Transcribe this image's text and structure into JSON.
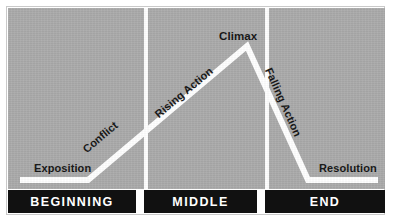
{
  "diagram": {
    "panel_color": "#a9a9a9",
    "line_color": "#ffffff",
    "bar_color": "#111111",
    "text_color": "#111111"
  },
  "arc_labels": {
    "exposition": "Exposition",
    "conflict": "Conflict",
    "rising_action": "Rising Action",
    "climax": "Climax",
    "falling_action": "Falling Action",
    "resolution": "Resolution"
  },
  "stages": [
    {
      "label": "BEGINNING"
    },
    {
      "label": "MIDDLE"
    },
    {
      "label": "END"
    }
  ],
  "chart_data": {
    "type": "line",
    "xlabel": "",
    "ylabel": "",
    "grid": false,
    "legend": "none",
    "xlim": [
      0,
      377
    ],
    "ylim": [
      0,
      181
    ],
    "series": [
      {
        "name": "Story Arc",
        "points": [
          {
            "x": 12,
            "y": 172,
            "stage": "Exposition"
          },
          {
            "x": 80,
            "y": 172,
            "stage": "Conflict start"
          },
          {
            "x": 239,
            "y": 38,
            "stage": "Climax"
          },
          {
            "x": 300,
            "y": 172,
            "stage": "Resolution start"
          },
          {
            "x": 370,
            "y": 172,
            "stage": "Resolution end"
          }
        ]
      }
    ],
    "annotations": [
      {
        "text": "Exposition",
        "x": 26,
        "y": 154,
        "rotation": 0
      },
      {
        "text": "Conflict",
        "x": 80,
        "y": 135,
        "rotation": -40
      },
      {
        "text": "Rising Action",
        "x": 152,
        "y": 100,
        "rotation": -40
      },
      {
        "text": "Climax",
        "x": 211,
        "y": 22,
        "rotation": 0
      },
      {
        "text": "Falling Action",
        "x": 266,
        "y": 58,
        "rotation": 66
      },
      {
        "text": "Resolution",
        "x": 311,
        "y": 154,
        "rotation": 0
      }
    ],
    "act_dividers": [
      136,
      257
    ],
    "categories": [
      "BEGINNING",
      "MIDDLE",
      "END"
    ]
  }
}
